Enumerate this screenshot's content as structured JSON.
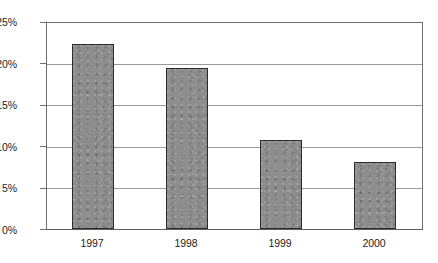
{
  "chart_data": {
    "type": "bar",
    "title": "",
    "subtitle": "",
    "xlabel": "",
    "ylabel": "",
    "categories": [
      "1997",
      "1998",
      "1999",
      "2000"
    ],
    "values": [
      22.4,
      19.6,
      10.8,
      8.1
    ],
    "value_labels": [
      "22.4%",
      "19.6%",
      "10.8%",
      "8.1%"
    ],
    "ylim": [
      0,
      25
    ],
    "ytick_values": [
      0,
      5,
      10,
      15,
      20,
      25
    ],
    "ytick_labels": [
      "0%",
      "5%",
      "10%",
      "15%",
      "20%",
      "25%"
    ],
    "grid": true,
    "grid_axis": "y",
    "legend": false,
    "legend_position": "none",
    "series": [
      {
        "name": "",
        "values": [
          22.4,
          19.6,
          10.8,
          8.1
        ],
        "color": "#8d8d8d",
        "border_color": "#2b2b2b"
      }
    ],
    "colors": {
      "bar_fill": "#8d8d8d",
      "bar_border": "#2b2b2b",
      "gridline": "#9a9a9a",
      "axis": "#6f6f6f",
      "text": "#1c1c1c",
      "background": "#ffffff"
    }
  }
}
